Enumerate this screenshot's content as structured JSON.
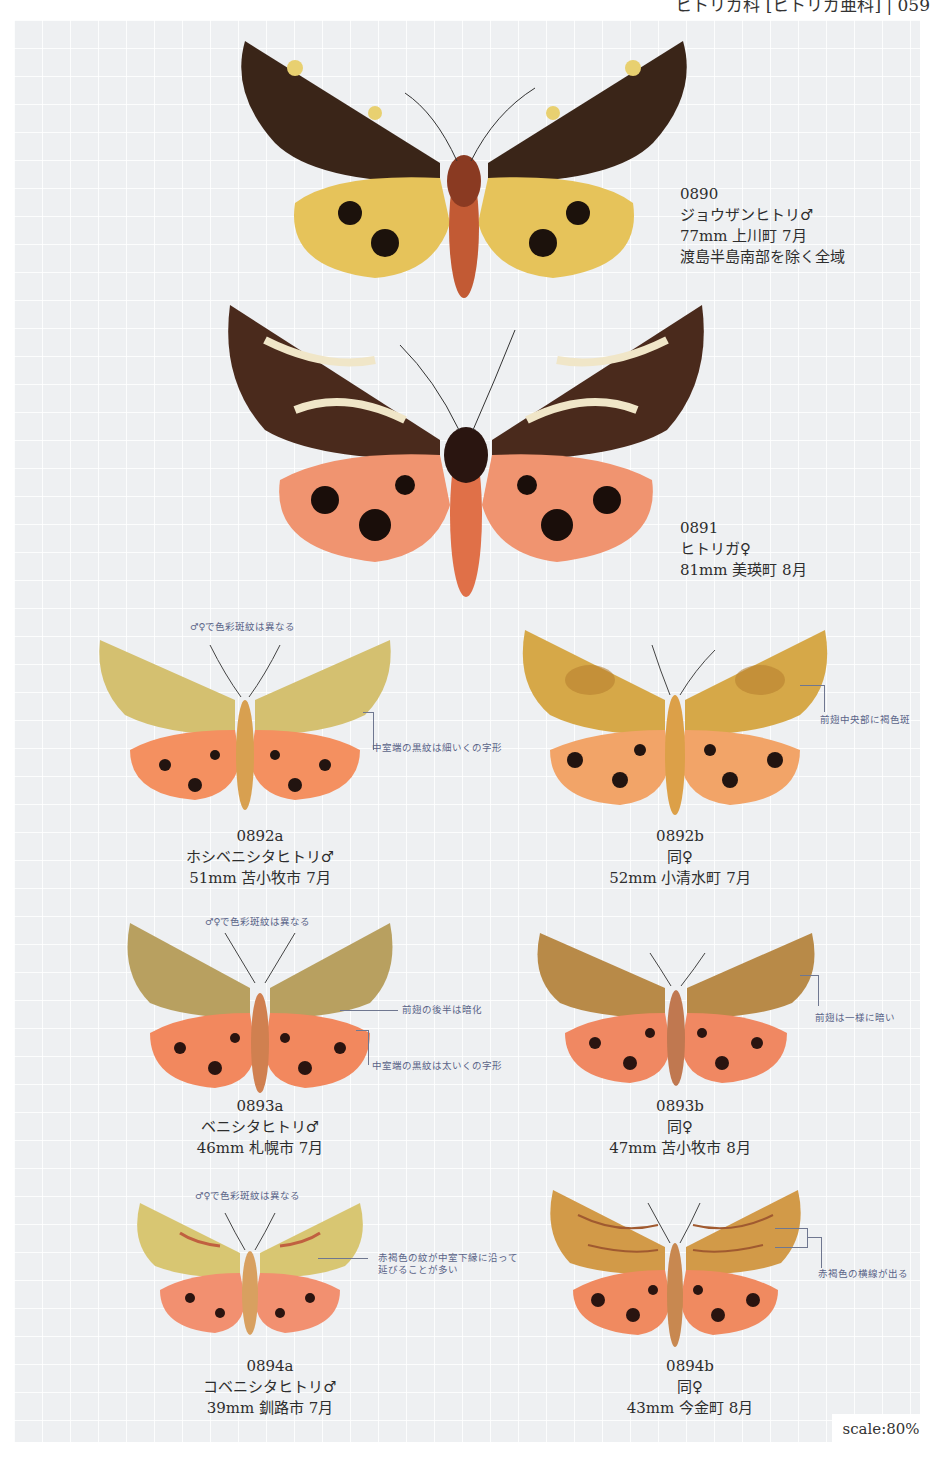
{
  "page": {
    "header_fragment": "ヒトリガ科 [ヒトリガ亜科] | 059",
    "scale_label": "scale:80%",
    "colors": {
      "grid_background": "#eef0f2",
      "note_text": "#5a6488",
      "label_text": "#2d2d2d"
    }
  },
  "specimens": [
    {
      "id": "0890",
      "name": "ジョウザンヒトリ♂",
      "details": "77mm 上川町 7月",
      "range": "渡島半島南部を除く全域",
      "forewing_color": "#3a2518",
      "hindwing_color": "#e6c35a",
      "notes": []
    },
    {
      "id": "0891",
      "name": "ヒトリガ♀",
      "details": "81mm 美瑛町 8月",
      "forewing_color": "#4a2a1c",
      "hindwing_color": "#f09470",
      "notes": []
    },
    {
      "id": "0892a",
      "name": "ホシベニシタヒトリ♂",
      "details": "51mm 苫小牧市 7月",
      "forewing_color": "#d4c070",
      "hindwing_color": "#f49060",
      "notes": [
        "♂♀で色彩斑紋は異なる",
        "中室端の黒紋は細いくの字形"
      ]
    },
    {
      "id": "0892b",
      "name": "同♀",
      "details": "52mm 小清水町 7月",
      "forewing_color": "#d6a848",
      "hindwing_color": "#f2a468",
      "notes": [
        "前翅中央部に褐色斑"
      ]
    },
    {
      "id": "0893a",
      "name": "ベニシタヒトリ♂",
      "details": "46mm 札幌市 7月",
      "forewing_color": "#b8a060",
      "hindwing_color": "#f2885e",
      "notes": [
        "♂♀で色彩斑紋は異なる",
        "前翅の後半は暗化",
        "中室端の黒紋は太いくの字形"
      ]
    },
    {
      "id": "0893b",
      "name": "同♀",
      "details": "47mm 苫小牧市 8月",
      "forewing_color": "#b88a48",
      "hindwing_color": "#f08862",
      "notes": [
        "前翅は一様に暗い"
      ]
    },
    {
      "id": "0894a",
      "name": "コベニシタヒトリ♂",
      "details": "39mm 釧路市 7月",
      "forewing_color": "#d8c672",
      "hindwing_color": "#f29070",
      "notes": [
        "♂♀で色彩斑紋は異なる",
        "赤褐色の紋が中室下縁に沿って",
        "延びることが多い"
      ]
    },
    {
      "id": "0894b",
      "name": "同♀",
      "details": "43mm 今金町 8月",
      "forewing_color": "#d29a48",
      "hindwing_color": "#f08a60",
      "notes": [
        "赤褐色の横線が出る"
      ]
    }
  ]
}
